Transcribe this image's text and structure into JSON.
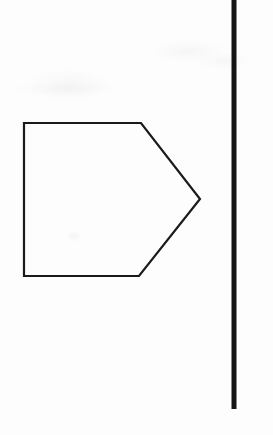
{
  "document": {
    "title": "Geometric Diagram",
    "background_color": "#fdfdfd",
    "ink_color": "#1a1a1a",
    "width": 273,
    "height": 435
  },
  "figure": {
    "caption": "",
    "shapes": [
      {
        "id": "pentagon",
        "name": "home-plate-pentagon",
        "description": "Right-pointing pentagon (home plate / arrow block)",
        "stroke_color": "#1a1a1a",
        "stroke_width": 2.2,
        "fill": "none",
        "points": "24,123 141,123 200,199 139,276 24,276",
        "vertices": [
          {
            "label": "top-left",
            "x": 24,
            "y": 123
          },
          {
            "label": "top-right",
            "x": 141,
            "y": 123
          },
          {
            "label": "apex-right",
            "x": 200,
            "y": 199
          },
          {
            "label": "bottom-right",
            "x": 139,
            "y": 276
          },
          {
            "label": "bottom-left",
            "x": 24,
            "y": 276
          }
        ]
      },
      {
        "id": "vertical-rule",
        "name": "vertical-line",
        "description": "Thick vertical rule near right margin",
        "stroke_color": "#141414",
        "stroke_width": 5,
        "x1": 234,
        "y1": 0,
        "x2": 234,
        "y2": 409
      }
    ]
  }
}
